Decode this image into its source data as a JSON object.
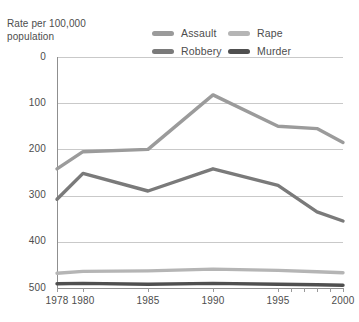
{
  "header": {
    "axis_title": "Rate per 100,000\npopulation"
  },
  "legend": {
    "position": "top-right",
    "items": [
      {
        "label": "Assault",
        "color": "#9b9b9b",
        "swatch": "legend-swatch-assault"
      },
      {
        "label": "Rape",
        "color": "#b5b5b5",
        "swatch": "legend-swatch-rape"
      },
      {
        "label": "Robbery",
        "color": "#7a7a7a",
        "swatch": "legend-swatch-robbery"
      },
      {
        "label": "Murder",
        "color": "#4f4f4f",
        "swatch": "legend-swatch-murder"
      }
    ]
  },
  "axes": {
    "y_ticks": [
      "500",
      "400",
      "300",
      "200",
      "100",
      "0"
    ],
    "x_ticks": [
      "1978",
      "1980",
      "1985",
      "1990",
      "1995",
      "2000"
    ],
    "y_title": "Rate per 100,000 population"
  },
  "chart_data": {
    "type": "line",
    "title": "Rate per 100,000 population",
    "xlabel": "",
    "ylabel": "Rate per 100,000 population",
    "xlim": [
      1978,
      2000
    ],
    "ylim": [
      0,
      500
    ],
    "ytick_values": [
      0,
      100,
      200,
      300,
      400,
      500
    ],
    "xtick_values": [
      1978,
      1980,
      1985,
      1990,
      1995,
      2000
    ],
    "grid": "horizontal",
    "legend_position": "top-right",
    "x": [
      1978,
      1980,
      1985,
      1990,
      1995,
      1998,
      2000
    ],
    "series": [
      {
        "name": "Assault",
        "color": "#9b9b9b",
        "values": [
          258,
          295,
          300,
          418,
          350,
          345,
          315
        ]
      },
      {
        "name": "Robbery",
        "color": "#7a7a7a",
        "values": [
          192,
          248,
          210,
          258,
          222,
          165,
          145
        ]
      },
      {
        "name": "Rape",
        "color": "#b5b5b5",
        "values": [
          32,
          36,
          37,
          41,
          38,
          35,
          33
        ]
      },
      {
        "name": "Murder",
        "color": "#4f4f4f",
        "values": [
          9,
          10,
          8,
          10,
          8,
          7,
          6
        ]
      }
    ]
  }
}
